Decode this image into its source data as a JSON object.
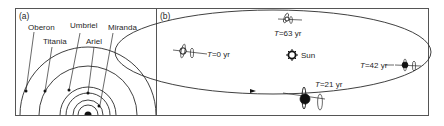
{
  "figure": {
    "panel_a": {
      "label": "(a)",
      "planet": "Uranus",
      "moons": [
        {
          "name": "Oberon",
          "label": "Oberon"
        },
        {
          "name": "Titania",
          "label": "Titania"
        },
        {
          "name": "Umbriel",
          "label": "Umbriel"
        },
        {
          "name": "Ariel",
          "label": "Ariel"
        },
        {
          "name": "Miranda",
          "label": "Miranda"
        }
      ]
    },
    "panel_b": {
      "label": "(b)",
      "sun_label": "Sun",
      "positions": [
        {
          "label": "T=0 yr",
          "t_symbol": "T",
          "value": "=0 yr"
        },
        {
          "label": "T=21 yr",
          "t_symbol": "T",
          "value": "=21 yr"
        },
        {
          "label": "T=42 yr",
          "t_symbol": "T",
          "value": "=42 yr"
        },
        {
          "label": "T=63 yr",
          "t_symbol": "T",
          "value": "=63 yr"
        }
      ]
    },
    "colors": {
      "line": "#2a2a2a",
      "frame": "#555555",
      "background": "#ffffff"
    }
  }
}
